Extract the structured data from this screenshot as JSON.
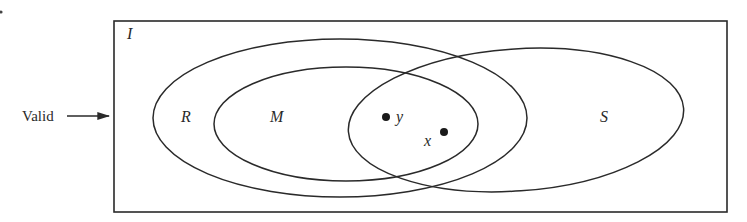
{
  "diagram": {
    "type": "venn",
    "universe": {
      "label": "I",
      "x": 114,
      "y": 21,
      "w": 613,
      "h": 191
    },
    "pointer": {
      "label": "Valid",
      "target": "I"
    },
    "sets": [
      {
        "id": "R",
        "label": "R",
        "cx": 340,
        "cy": 118,
        "rx": 187,
        "ry": 79
      },
      {
        "id": "M",
        "label": "M",
        "cx": 346,
        "cy": 124,
        "rx": 132,
        "ry": 57
      },
      {
        "id": "S",
        "label": "S",
        "cx": 516,
        "cy": 120,
        "rx": 168,
        "ry": 71
      }
    ],
    "points": [
      {
        "id": "y",
        "label": "y",
        "cx": 386,
        "cy": 117,
        "region": "R ∩ M ∩ S"
      },
      {
        "id": "x",
        "label": "x",
        "cx": 444,
        "cy": 133,
        "region": "R ∩ S, outside M"
      }
    ],
    "stroke_color": "#2a2a2a"
  }
}
